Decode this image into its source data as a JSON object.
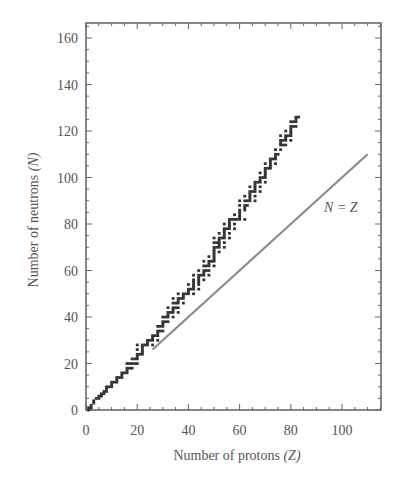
{
  "chart_data": {
    "type": "scatter",
    "title": "",
    "xlabel": "Number of protons",
    "xlabel_symbol": "(Z)",
    "ylabel": "Number of neutrons",
    "ylabel_symbol": "(N)",
    "xlim": [
      0,
      115
    ],
    "ylim": [
      0,
      166
    ],
    "xticks": [
      0,
      20,
      40,
      60,
      80,
      100
    ],
    "yticks": [
      0,
      20,
      40,
      60,
      80,
      100,
      120,
      140,
      160
    ],
    "grid": false,
    "legend": null,
    "annotations": [
      {
        "text": "N = Z",
        "x": 93,
        "y": 85
      }
    ],
    "series": [
      {
        "name": "Stable nuclei",
        "type": "scatter",
        "color": "#333333",
        "points": [
          [
            1,
            0
          ],
          [
            1,
            1
          ],
          [
            2,
            1
          ],
          [
            2,
            2
          ],
          [
            3,
            3
          ],
          [
            3,
            4
          ],
          [
            4,
            5
          ],
          [
            5,
            5
          ],
          [
            5,
            6
          ],
          [
            6,
            6
          ],
          [
            6,
            7
          ],
          [
            7,
            7
          ],
          [
            7,
            8
          ],
          [
            8,
            8
          ],
          [
            8,
            9
          ],
          [
            8,
            10
          ],
          [
            9,
            10
          ],
          [
            10,
            10
          ],
          [
            10,
            11
          ],
          [
            10,
            12
          ],
          [
            11,
            12
          ],
          [
            12,
            12
          ],
          [
            12,
            13
          ],
          [
            12,
            14
          ],
          [
            13,
            14
          ],
          [
            14,
            14
          ],
          [
            14,
            15
          ],
          [
            14,
            16
          ],
          [
            15,
            16
          ],
          [
            16,
            16
          ],
          [
            16,
            17
          ],
          [
            16,
            18
          ],
          [
            16,
            20
          ],
          [
            17,
            18
          ],
          [
            17,
            20
          ],
          [
            18,
            18
          ],
          [
            18,
            20
          ],
          [
            18,
            22
          ],
          [
            19,
            20
          ],
          [
            19,
            22
          ],
          [
            20,
            20
          ],
          [
            20,
            22
          ],
          [
            20,
            23
          ],
          [
            20,
            24
          ],
          [
            20,
            26
          ],
          [
            20,
            28
          ],
          [
            21,
            24
          ],
          [
            22,
            24
          ],
          [
            22,
            25
          ],
          [
            22,
            26
          ],
          [
            22,
            27
          ],
          [
            22,
            28
          ],
          [
            23,
            28
          ],
          [
            24,
            28
          ],
          [
            24,
            29
          ],
          [
            24,
            30
          ],
          [
            25,
            30
          ],
          [
            26,
            28
          ],
          [
            26,
            30
          ],
          [
            26,
            31
          ],
          [
            26,
            32
          ],
          [
            27,
            32
          ],
          [
            28,
            30
          ],
          [
            28,
            32
          ],
          [
            28,
            33
          ],
          [
            28,
            34
          ],
          [
            28,
            36
          ],
          [
            29,
            34
          ],
          [
            29,
            36
          ],
          [
            30,
            34
          ],
          [
            30,
            36
          ],
          [
            30,
            37
          ],
          [
            30,
            38
          ],
          [
            30,
            40
          ],
          [
            31,
            38
          ],
          [
            31,
            40
          ],
          [
            32,
            38
          ],
          [
            32,
            40
          ],
          [
            32,
            41
          ],
          [
            32,
            42
          ],
          [
            32,
            44
          ],
          [
            33,
            42
          ],
          [
            34,
            40
          ],
          [
            34,
            42
          ],
          [
            34,
            43
          ],
          [
            34,
            44
          ],
          [
            34,
            46
          ],
          [
            34,
            48
          ],
          [
            35,
            44
          ],
          [
            35,
            46
          ],
          [
            36,
            42
          ],
          [
            36,
            44
          ],
          [
            36,
            46
          ],
          [
            36,
            47
          ],
          [
            36,
            48
          ],
          [
            36,
            50
          ],
          [
            37,
            48
          ],
          [
            38,
            46
          ],
          [
            38,
            48
          ],
          [
            38,
            49
          ],
          [
            38,
            50
          ],
          [
            39,
            50
          ],
          [
            40,
            50
          ],
          [
            40,
            51
          ],
          [
            40,
            52
          ],
          [
            40,
            54
          ],
          [
            41,
            52
          ],
          [
            42,
            50
          ],
          [
            42,
            52
          ],
          [
            42,
            53
          ],
          [
            42,
            54
          ],
          [
            42,
            55
          ],
          [
            42,
            56
          ],
          [
            42,
            58
          ],
          [
            44,
            52
          ],
          [
            44,
            54
          ],
          [
            44,
            55
          ],
          [
            44,
            56
          ],
          [
            44,
            57
          ],
          [
            44,
            58
          ],
          [
            44,
            60
          ],
          [
            45,
            58
          ],
          [
            46,
            56
          ],
          [
            46,
            58
          ],
          [
            46,
            59
          ],
          [
            46,
            60
          ],
          [
            46,
            62
          ],
          [
            46,
            64
          ],
          [
            47,
            60
          ],
          [
            47,
            62
          ],
          [
            48,
            58
          ],
          [
            48,
            60
          ],
          [
            48,
            62
          ],
          [
            48,
            63
          ],
          [
            48,
            64
          ],
          [
            48,
            66
          ],
          [
            49,
            64
          ],
          [
            50,
            62
          ],
          [
            50,
            64
          ],
          [
            50,
            65
          ],
          [
            50,
            66
          ],
          [
            50,
            67
          ],
          [
            50,
            68
          ],
          [
            50,
            69
          ],
          [
            50,
            70
          ],
          [
            50,
            72
          ],
          [
            50,
            74
          ],
          [
            51,
            70
          ],
          [
            51,
            72
          ],
          [
            52,
            68
          ],
          [
            52,
            70
          ],
          [
            52,
            71
          ],
          [
            52,
            72
          ],
          [
            52,
            73
          ],
          [
            52,
            74
          ],
          [
            52,
            76
          ],
          [
            53,
            74
          ],
          [
            54,
            70
          ],
          [
            54,
            72
          ],
          [
            54,
            74
          ],
          [
            54,
            75
          ],
          [
            54,
            76
          ],
          [
            54,
            77
          ],
          [
            54,
            78
          ],
          [
            54,
            80
          ],
          [
            55,
            78
          ],
          [
            56,
            74
          ],
          [
            56,
            76
          ],
          [
            56,
            78
          ],
          [
            56,
            79
          ],
          [
            56,
            80
          ],
          [
            56,
            81
          ],
          [
            56,
            82
          ],
          [
            57,
            82
          ],
          [
            58,
            78
          ],
          [
            58,
            80
          ],
          [
            58,
            82
          ],
          [
            58,
            84
          ],
          [
            59,
            82
          ],
          [
            60,
            82
          ],
          [
            60,
            83
          ],
          [
            60,
            84
          ],
          [
            60,
            85
          ],
          [
            60,
            86
          ],
          [
            60,
            88
          ],
          [
            60,
            90
          ],
          [
            62,
            82
          ],
          [
            62,
            86
          ],
          [
            62,
            87
          ],
          [
            62,
            88
          ],
          [
            62,
            90
          ],
          [
            62,
            92
          ],
          [
            63,
            88
          ],
          [
            63,
            90
          ],
          [
            64,
            90
          ],
          [
            64,
            91
          ],
          [
            64,
            92
          ],
          [
            64,
            93
          ],
          [
            64,
            94
          ],
          [
            64,
            96
          ],
          [
            65,
            94
          ],
          [
            66,
            90
          ],
          [
            66,
            92
          ],
          [
            66,
            94
          ],
          [
            66,
            95
          ],
          [
            66,
            96
          ],
          [
            66,
            97
          ],
          [
            66,
            98
          ],
          [
            67,
            98
          ],
          [
            68,
            94
          ],
          [
            68,
            96
          ],
          [
            68,
            98
          ],
          [
            68,
            99
          ],
          [
            68,
            100
          ],
          [
            68,
            102
          ],
          [
            69,
            100
          ],
          [
            70,
            98
          ],
          [
            70,
            100
          ],
          [
            70,
            101
          ],
          [
            70,
            102
          ],
          [
            70,
            103
          ],
          [
            70,
            104
          ],
          [
            70,
            106
          ],
          [
            71,
            104
          ],
          [
            72,
            104
          ],
          [
            72,
            105
          ],
          [
            72,
            106
          ],
          [
            72,
            107
          ],
          [
            72,
            108
          ],
          [
            73,
            108
          ],
          [
            74,
            106
          ],
          [
            74,
            108
          ],
          [
            74,
            109
          ],
          [
            74,
            110
          ],
          [
            74,
            112
          ],
          [
            75,
            110
          ],
          [
            76,
            112
          ],
          [
            76,
            114
          ],
          [
            76,
            115
          ],
          [
            76,
            116
          ],
          [
            76,
            118
          ],
          [
            77,
            114
          ],
          [
            77,
            116
          ],
          [
            78,
            114
          ],
          [
            78,
            116
          ],
          [
            78,
            117
          ],
          [
            78,
            118
          ],
          [
            78,
            120
          ],
          [
            79,
            118
          ],
          [
            80,
            116
          ],
          [
            80,
            118
          ],
          [
            80,
            119
          ],
          [
            80,
            120
          ],
          [
            80,
            121
          ],
          [
            80,
            122
          ],
          [
            80,
            124
          ],
          [
            81,
            122
          ],
          [
            81,
            124
          ],
          [
            82,
            122
          ],
          [
            82,
            124
          ],
          [
            82,
            125
          ],
          [
            82,
            126
          ],
          [
            83,
            126
          ]
        ]
      },
      {
        "name": "N = Z",
        "type": "line",
        "color": "#8a8a8a",
        "x": [
          26,
          110
        ],
        "y": [
          26,
          110
        ]
      }
    ]
  },
  "chart": {
    "xlabel_text": "Number of protons ",
    "xlabel_sym": "(Z)",
    "ylabel_text": "Number of neutrons ",
    "ylabel_sym": "(N)",
    "nz_label": "N = Z"
  }
}
